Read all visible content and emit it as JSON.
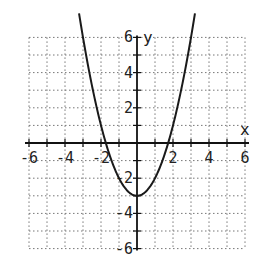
{
  "chart_data": {
    "type": "line",
    "title": "",
    "xlabel": "x",
    "ylabel": "y",
    "xlim": [
      -6,
      6
    ],
    "ylim": [
      -6,
      6
    ],
    "grid": true,
    "grid_style": "dotted",
    "x_ticks": [
      -6,
      -4,
      -2,
      2,
      4,
      6
    ],
    "y_ticks": [
      6,
      4,
      2,
      -2,
      -4,
      -6
    ],
    "x_tick_labels": [
      "-6",
      "-4",
      "-2",
      "2",
      "4",
      "6"
    ],
    "y_tick_labels": [
      "6",
      "4",
      "2",
      "-2",
      "-4",
      "-6"
    ],
    "series": [
      {
        "name": "parabola",
        "equation": "y = x^2 - 3",
        "x": [
          -3.0,
          -2.5,
          -2.0,
          -1.73,
          -1.5,
          -1.0,
          -0.5,
          0.0,
          0.5,
          1.0,
          1.5,
          1.73,
          2.0,
          2.5,
          3.0
        ],
        "y": [
          6.0,
          3.25,
          1.0,
          0.0,
          -0.75,
          -2.0,
          -2.75,
          -3.0,
          -2.75,
          -2.0,
          -0.75,
          0.0,
          1.0,
          3.25,
          6.0
        ],
        "vertex": [
          0,
          -3
        ],
        "x_intercepts": [
          -1.73,
          1.73
        ],
        "color": "#1a1a1a"
      }
    ]
  },
  "labels": {
    "x_axis": "x",
    "y_axis": "y"
  }
}
